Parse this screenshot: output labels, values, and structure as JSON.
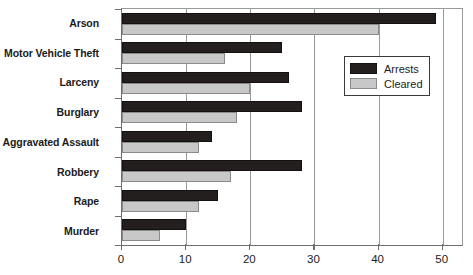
{
  "chart_data": {
    "type": "bar",
    "orientation": "horizontal",
    "title": "",
    "xlabel": "",
    "ylabel": "",
    "xlim": [
      0,
      53
    ],
    "ylim": null,
    "grid": true,
    "legend_position": "right-top",
    "xticks": [
      0,
      10,
      20,
      30,
      40,
      50
    ],
    "xticklabels": [
      "0",
      "10",
      "20",
      "30",
      "40",
      "50"
    ],
    "categories": [
      "Arson",
      "Motor Vehicle Theft",
      "Larceny",
      "Burglary",
      "Aggravated Assault",
      "Robbery",
      "Rape",
      "Murder"
    ],
    "series": [
      {
        "name": "Arrests",
        "color": "#231f1f",
        "values": [
          49,
          25,
          26,
          28,
          14,
          28,
          15,
          10
        ]
      },
      {
        "name": "Cleared",
        "color": "#c8c8c8",
        "values": [
          40,
          16,
          20,
          18,
          12,
          17,
          12,
          6
        ]
      }
    ]
  },
  "legend": {
    "entries": [
      {
        "label": "Arrests",
        "color": "#231f1f"
      },
      {
        "label": "Cleared",
        "color": "#c8c8c8"
      }
    ]
  }
}
